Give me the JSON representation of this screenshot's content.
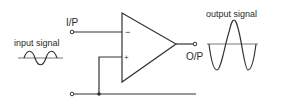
{
  "diagram": {
    "labels": {
      "input_terminal": "I/P",
      "output_terminal": "O/P",
      "input_signal": "input signal",
      "output_signal": "output signal",
      "inverting_pin": "−",
      "non_inverting_pin": "+"
    },
    "colors": {
      "line": "#333333",
      "text": "#2a2a2a",
      "background": "#ffffff"
    }
  }
}
